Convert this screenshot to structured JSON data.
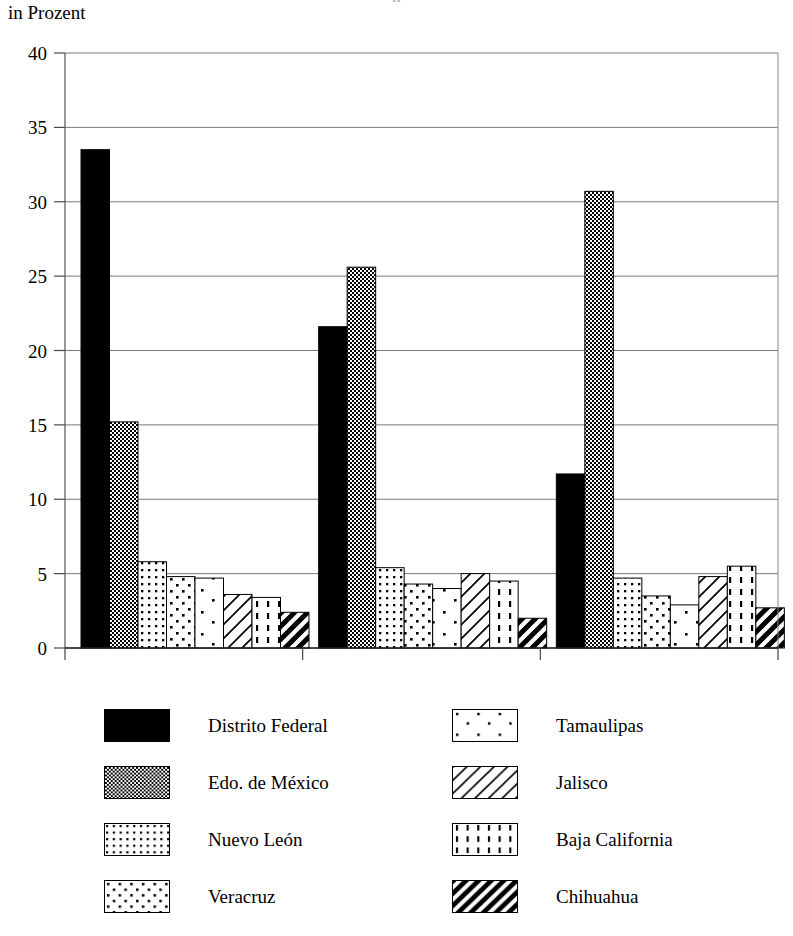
{
  "page": {
    "clipped_title": "g"
  },
  "axis_unit_label": "in Prozent",
  "legend": {
    "columns": [
      {
        "items": [
          {
            "label": "Distrito Federal",
            "pattern": "solid-black"
          },
          {
            "label": "Edo. de México",
            "pattern": "checker-dense"
          },
          {
            "label": "Nuevo León",
            "pattern": "dots-dense"
          },
          {
            "label": "Veracruz",
            "pattern": "dots-medium"
          }
        ]
      },
      {
        "items": [
          {
            "label": "Tamaulipas",
            "pattern": "dots-sparse"
          },
          {
            "label": "Jalisco",
            "pattern": "diagonal-thin"
          },
          {
            "label": "Baja California",
            "pattern": "dashes-vertical"
          },
          {
            "label": "Chihuahua",
            "pattern": "diagonal-bold"
          }
        ]
      }
    ]
  },
  "chart_data": {
    "type": "bar",
    "title": "",
    "xlabel": "",
    "ylabel": "in Prozent",
    "ylim": [
      0,
      40
    ],
    "yticks": [
      0,
      5,
      10,
      15,
      20,
      25,
      30,
      35,
      40
    ],
    "ytick_labels": [
      "0",
      "5",
      "10",
      "15",
      "20",
      "25",
      "30",
      "35",
      "40"
    ],
    "grid": true,
    "legend_position": "bottom",
    "categories": [
      "1970",
      "1980",
      "1995"
    ],
    "series": [
      {
        "name": "Distrito Federal",
        "pattern": "solid-black",
        "values": [
          33.5,
          21.6,
          11.7
        ]
      },
      {
        "name": "Edo. de México",
        "pattern": "checker-dense",
        "values": [
          15.2,
          25.6,
          30.7
        ]
      },
      {
        "name": "Nuevo León",
        "pattern": "dots-dense",
        "values": [
          5.8,
          5.4,
          4.7
        ]
      },
      {
        "name": "Veracruz",
        "pattern": "dots-medium",
        "values": [
          4.8,
          4.3,
          3.5
        ]
      },
      {
        "name": "Tamaulipas",
        "pattern": "dots-sparse",
        "values": [
          4.7,
          4.0,
          2.9
        ]
      },
      {
        "name": "Jalisco",
        "pattern": "diagonal-thin",
        "values": [
          3.6,
          5.0,
          4.8
        ]
      },
      {
        "name": "Baja California",
        "pattern": "dashes-vertical",
        "values": [
          3.4,
          4.5,
          5.5
        ]
      },
      {
        "name": "Chihuahua",
        "pattern": "diagonal-bold",
        "values": [
          2.4,
          2.0,
          2.7
        ]
      }
    ]
  }
}
